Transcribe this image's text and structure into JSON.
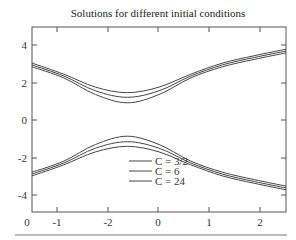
{
  "chart_data": {
    "type": "line",
    "title": "Solutions for different initial conditions",
    "xlabel": "",
    "ylabel": "",
    "xlim": [
      -1.5,
      2.5
    ],
    "ylim": [
      -5,
      5
    ],
    "grid": false,
    "legend_position": "lower center (inside)",
    "x_tick_labels": [
      "0",
      "-1",
      "-2",
      "0",
      "1",
      "2"
    ],
    "y_tick_labels": [
      "4",
      "2",
      "0",
      "-2",
      "-4"
    ],
    "series": [
      {
        "name": "C = 3/2",
        "branch_upper": {
          "x": [
            -1.5,
            -1,
            -0.5,
            0,
            0.5,
            1,
            1.5,
            2,
            2.5
          ],
          "y": [
            3.05,
            2.45,
            1.75,
            1.45,
            1.75,
            2.45,
            3.05,
            3.45,
            3.8
          ]
        },
        "branch_lower": {
          "x": [
            -1.5,
            -1,
            -0.5,
            0,
            0.5,
            1,
            1.5,
            2,
            2.5
          ],
          "y": [
            -3.05,
            -2.45,
            -1.75,
            -1.45,
            -1.75,
            -2.45,
            -3.05,
            -3.45,
            -3.8
          ]
        }
      },
      {
        "name": "C = 6",
        "branch_upper": {
          "x": [
            -1.5,
            -1,
            -0.5,
            0,
            0.5,
            1,
            1.5,
            2,
            2.5
          ],
          "y": [
            2.95,
            2.35,
            1.55,
            1.2,
            1.55,
            2.35,
            2.95,
            3.35,
            3.7
          ]
        },
        "branch_lower": {
          "x": [
            -1.5,
            -1,
            -0.5,
            0,
            0.5,
            1,
            1.5,
            2,
            2.5
          ],
          "y": [
            -2.95,
            -2.35,
            -1.55,
            -1.2,
            -1.55,
            -2.35,
            -2.95,
            -3.35,
            -3.7
          ]
        }
      },
      {
        "name": "C = 24",
        "branch_upper": {
          "x": [
            -1.5,
            -1,
            -0.5,
            0,
            0.5,
            1,
            1.5,
            2,
            2.5
          ],
          "y": [
            2.85,
            2.25,
            1.35,
            0.9,
            1.35,
            2.25,
            2.85,
            3.25,
            3.6
          ]
        },
        "branch_lower": {
          "x": [
            -1.5,
            -1,
            -0.5,
            0,
            0.5,
            1,
            1.5,
            2,
            2.5
          ],
          "y": [
            -2.85,
            -2.25,
            -1.35,
            -0.9,
            -1.35,
            -2.25,
            -2.85,
            -3.25,
            -3.6
          ]
        }
      }
    ]
  },
  "legend": {
    "items": [
      {
        "label": "C = 3/2"
      },
      {
        "label": "C = 6"
      },
      {
        "label": "C = 24"
      }
    ]
  }
}
